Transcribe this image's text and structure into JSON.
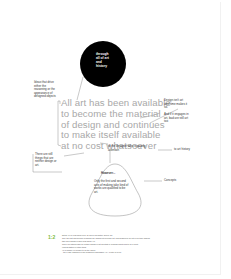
{
  "diagram": {
    "center_node": "through all of art and history",
    "main_statement": "All art has been available to become the material of design and continues to make itself available at no cost whatsoever",
    "left_top_note": "Ideas that drive either the reasoning or the appearance of designed objects",
    "left_bottom_note": "There are still things that are neither design or art.",
    "right_top_note": "Design isn't art until time makes it so.",
    "right_mid_note": "And if it engages in art, bad are still art too",
    "designer_note": "to the designer who is paying attention",
    "art_history_label": "to art history",
    "however_label": "However...",
    "blob_text": "Only the first and second acts of making take kind of works are qualified to be art.",
    "concepts_label": "Concepts"
  },
  "footnote": {
    "badge": "1:2",
    "lines": [
      "Notes: (1) by first-hand view, (2) and in art history and by art",
      "Only the first and second of making are qualified to become art, and qualified to be art in our time making",
      "take as a design in itself (first figure) (1)",
      "There is a strong case for neither design or art and that in a design about fluid to be a point",
      "representation of either thing",
      "(1) a primary or preface to be the object",
      "- the ill-ago embodied in the designer's 'discussion' (1) / a note to a line"
    ]
  },
  "colors": {
    "accent": "#7dbb3c",
    "circle": "#000000",
    "main_text": "#a8a8a8"
  }
}
